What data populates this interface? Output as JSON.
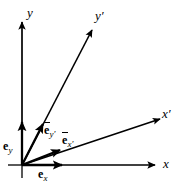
{
  "figure": {
    "background_color": "#ffffff",
    "stroke_color": "#000000",
    "width": 185,
    "height": 185,
    "origin": {
      "x": 22,
      "y": 165
    }
  },
  "axes": [
    {
      "name": "y-axis",
      "label": "y",
      "prime": "",
      "label_x": 27,
      "label_y": 6,
      "from": {
        "x": 22,
        "y": 165
      },
      "to": {
        "x": 22,
        "y": 22
      }
    },
    {
      "name": "x-axis",
      "label": "x",
      "prime": "",
      "label_x": 163,
      "label_y": 157,
      "from": {
        "x": 22,
        "y": 165
      },
      "to": {
        "x": 155,
        "y": 165
      }
    },
    {
      "name": "y-prime-axis",
      "label": "y",
      "prime": "′",
      "label_x": 95,
      "label_y": 9,
      "from": {
        "x": 22,
        "y": 165
      },
      "to": {
        "x": 92,
        "y": 30
      }
    },
    {
      "name": "x-prime-axis",
      "label": "x",
      "prime": "′",
      "label_x": 162,
      "label_y": 107,
      "from": {
        "x": 22,
        "y": 165
      },
      "to": {
        "x": 160,
        "y": 119
      }
    }
  ],
  "basis_vectors": [
    {
      "name": "e-y",
      "symbol": "e",
      "subscript": "y",
      "overbar": false,
      "label_x": 3,
      "label_y": 140,
      "from": {
        "x": 22,
        "y": 165
      },
      "to": {
        "x": 22,
        "y": 122
      }
    },
    {
      "name": "e-x",
      "symbol": "e",
      "subscript": "x",
      "overbar": false,
      "label_x": 38,
      "label_y": 168,
      "from": {
        "x": 22,
        "y": 165
      },
      "to": {
        "x": 62,
        "y": 165
      }
    },
    {
      "name": "e-bar-y-prime",
      "symbol": "e",
      "subscript": "y′",
      "overbar": true,
      "label_x": 44,
      "label_y": 124,
      "from": {
        "x": 22,
        "y": 165
      },
      "to": {
        "x": 43,
        "y": 124
      }
    },
    {
      "name": "e-bar-x-prime",
      "symbol": "e",
      "subscript": "x′",
      "overbar": true,
      "label_x": 62,
      "label_y": 134,
      "from": {
        "x": 22,
        "y": 165
      },
      "to": {
        "x": 60,
        "y": 150
      }
    }
  ]
}
